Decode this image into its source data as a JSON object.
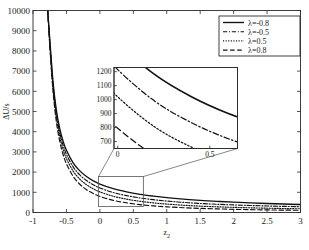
{
  "chart_data": {
    "type": "line",
    "title": "",
    "xlabel": "z2",
    "ylabel": "ΔU/s",
    "xlim": [
      -1,
      3
    ],
    "ylim": [
      0,
      10000
    ],
    "grid": false,
    "legend_position": "top-right",
    "xticks": [
      -1,
      -0.5,
      0,
      0.5,
      1,
      1.5,
      2,
      2.5,
      3
    ],
    "xtick_labels": [
      "-1",
      "-0.5",
      "0",
      "0.5",
      "1",
      "1.5",
      "2",
      "2.5",
      "3"
    ],
    "yticks": [
      0,
      1000,
      2000,
      3000,
      4000,
      5000,
      6000,
      7000,
      8000,
      9000,
      10000
    ],
    "ytick_labels": [
      "0",
      "1000",
      "2000",
      "3000",
      "4000",
      "5000",
      "6000",
      "7000",
      "8000",
      "9000",
      "10000"
    ],
    "series": [
      {
        "name": "λ=-0.8",
        "style": "solid",
        "x": [
          -0.78,
          -0.75,
          -0.7,
          -0.65,
          -0.6,
          -0.55,
          -0.5,
          -0.4,
          -0.3,
          -0.2,
          -0.1,
          0.0,
          0.2,
          0.4,
          0.6,
          0.8,
          1.0,
          1.25,
          1.5,
          1.75,
          2.0,
          2.25,
          2.5,
          2.75,
          3.0
        ],
        "y": [
          10000,
          8600,
          6450,
          5050,
          4150,
          3530,
          3080,
          2460,
          2060,
          1780,
          1570,
          1410,
          1180,
          1020,
          900,
          810,
          735,
          660,
          600,
          550,
          510,
          475,
          445,
          420,
          395
        ]
      },
      {
        "name": "λ=-0.5",
        "style": "dashdot",
        "x": [
          -0.78,
          -0.75,
          -0.7,
          -0.65,
          -0.6,
          -0.55,
          -0.5,
          -0.4,
          -0.3,
          -0.2,
          -0.1,
          0.0,
          0.2,
          0.4,
          0.6,
          0.8,
          1.0,
          1.25,
          1.5,
          1.75,
          2.0,
          2.25,
          2.5,
          2.75,
          3.0
        ],
        "y": [
          10000,
          8500,
          6300,
          4880,
          3960,
          3330,
          2880,
          2260,
          1860,
          1580,
          1375,
          1215,
          990,
          835,
          720,
          635,
          565,
          500,
          448,
          408,
          375,
          347,
          323,
          303,
          285
        ]
      },
      {
        "name": "λ=0.5",
        "style": "dotted",
        "x": [
          -0.78,
          -0.75,
          -0.7,
          -0.65,
          -0.6,
          -0.55,
          -0.5,
          -0.4,
          -0.3,
          -0.2,
          -0.1,
          0.0,
          0.2,
          0.4,
          0.6,
          0.8,
          1.0,
          1.25,
          1.5,
          1.75,
          2.0,
          2.25,
          2.5,
          2.75,
          3.0
        ],
        "y": [
          10000,
          8400,
          6150,
          4700,
          3760,
          3120,
          2670,
          2050,
          1650,
          1375,
          1175,
          1020,
          805,
          660,
          555,
          478,
          418,
          360,
          316,
          282,
          255,
          232,
          213,
          197,
          183
        ]
      },
      {
        "name": "λ=0.8",
        "style": "dashed",
        "x": [
          -0.78,
          -0.75,
          -0.7,
          -0.65,
          -0.6,
          -0.55,
          -0.5,
          -0.4,
          -0.3,
          -0.2,
          -0.1,
          0.0,
          0.2,
          0.4,
          0.6,
          0.8,
          1.0,
          1.25,
          1.5,
          1.75,
          2.0,
          2.25,
          2.5,
          2.75,
          3.0
        ],
        "y": [
          10000,
          8300,
          5980,
          4480,
          3520,
          2870,
          2410,
          1790,
          1400,
          1130,
          940,
          795,
          600,
          478,
          390,
          328,
          281,
          236,
          203,
          178,
          158,
          142,
          129,
          118,
          108
        ]
      }
    ],
    "inset": {
      "xlim": [
        -0.02,
        0.65
      ],
      "ylim": [
        650,
        1230
      ],
      "xticks": [
        0,
        0.5
      ],
      "xtick_labels": [
        "0",
        "0.5"
      ],
      "yticks": [
        700,
        800,
        900,
        1000,
        1100,
        1200
      ],
      "ytick_labels": [
        "700",
        "800",
        "900",
        "1000",
        "1100",
        "1200"
      ],
      "source_box": {
        "x0": -0.02,
        "x1": 0.65,
        "y0": 300,
        "y1": 1780
      }
    }
  },
  "legend": {
    "items": [
      {
        "label": "λ=-0.8",
        "style": "solid"
      },
      {
        "label": "λ=-0.5",
        "style": "dashdot"
      },
      {
        "label": "λ=0.5",
        "style": "dotted"
      },
      {
        "label": "λ=0.8",
        "style": "dashed"
      }
    ]
  },
  "colors": {
    "curve": "#111111",
    "axis": "#2b2b2b",
    "connector": "#555555",
    "background": "#ffffff"
  }
}
